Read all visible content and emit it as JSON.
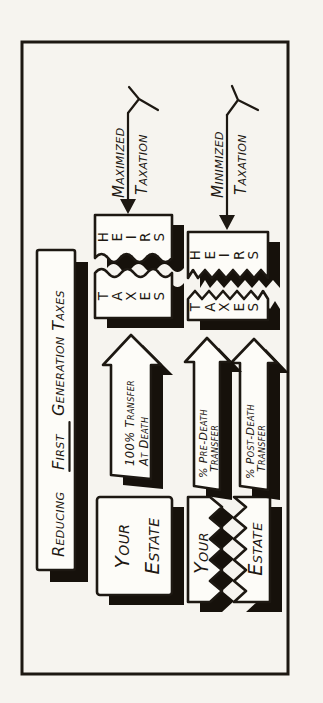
{
  "colors": {
    "ink": "#1d1812",
    "paper": "#f6f4ef",
    "box_fill": "#fdfcf8"
  },
  "title": {
    "part1": "Reducing",
    "part2": "First",
    "part3": "Generation Taxes"
  },
  "row1": {
    "estate_box": {
      "line1": "Your",
      "line2": "Estate"
    },
    "transfer_arrow": {
      "line1": "100% Transfer",
      "line2": "At Death"
    },
    "taxes_label": "TAXES",
    "heirs_label": "HEIRS",
    "outcome_label": {
      "line1": "Maximized",
      "line2": "Taxation"
    }
  },
  "row2": {
    "estate_box": {
      "line1": "Your",
      "line2": "Estate"
    },
    "pre_death_arrow": {
      "line1": "% Pre-Death",
      "line2": "Transfer"
    },
    "post_death_arrow": {
      "line1": "% Post-Death",
      "line2": "Transfer"
    },
    "taxes_label": "TAXES",
    "heirs_label": "HEIRS",
    "outcome_label": {
      "line1": "Minimized",
      "line2": "Taxation"
    }
  }
}
